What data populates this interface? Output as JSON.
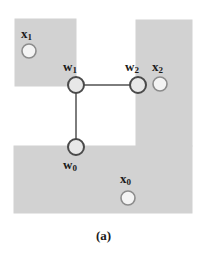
{
  "figure": {
    "caption": "(a)",
    "background_color": "#ffffff",
    "region_fill_color": "#d2d2d2",
    "region_edge_color": "#d2d2d2",
    "node_stroke_color": "#4a4a4a",
    "node_fill_color": "#e8e8e8",
    "point_stroke_color": "#8c8c8c",
    "point_fill_color": "#f4f4f4",
    "edge_color": "#7d7d7d"
  },
  "regions": [
    {
      "name": "upper-left-shaded-region",
      "x": 15,
      "y": 19,
      "width": 61,
      "height": 67
    },
    {
      "name": "right-shaded-region",
      "x": 136,
      "y": 20,
      "width": 56,
      "height": 126
    },
    {
      "name": "bottom-shaded-region",
      "x": 14,
      "y": 146,
      "width": 178,
      "height": 67
    }
  ],
  "nodes": [
    {
      "id": "w1",
      "label": "w",
      "subscript": "1",
      "cx": 76,
      "cy": 85,
      "r": 8,
      "label_x": 63,
      "label_y": 60
    },
    {
      "id": "w2",
      "label": "w",
      "subscript": "2",
      "cx": 138,
      "cy": 85,
      "r": 8,
      "label_x": 125,
      "label_y": 60
    },
    {
      "id": "w0",
      "label": "w",
      "subscript": "0",
      "cx": 76,
      "cy": 147,
      "r": 8,
      "label_x": 63,
      "label_y": 158
    }
  ],
  "points": [
    {
      "id": "x1",
      "label": "x",
      "subscript": "1",
      "cx": 29,
      "cy": 51,
      "r": 7,
      "label_x": 21,
      "label_y": 27
    },
    {
      "id": "x2",
      "label": "x",
      "subscript": "2",
      "cx": 160,
      "cy": 84,
      "r": 7,
      "label_x": 152,
      "label_y": 60
    },
    {
      "id": "x0",
      "label": "x",
      "subscript": "0",
      "cx": 128,
      "cy": 198,
      "r": 7,
      "label_x": 120,
      "label_y": 172
    }
  ],
  "edges": [
    {
      "name": "edge-w1-w2",
      "from": "w1",
      "to": "w2",
      "x1": 76,
      "y1": 85,
      "x2": 138,
      "y2": 85,
      "width": 2
    },
    {
      "name": "edge-w1-w0",
      "from": "w1",
      "to": "w0",
      "x1": 76,
      "y1": 85,
      "x2": 76,
      "y2": 147,
      "width": 2
    }
  ],
  "caption_position": {
    "top": 228
  }
}
